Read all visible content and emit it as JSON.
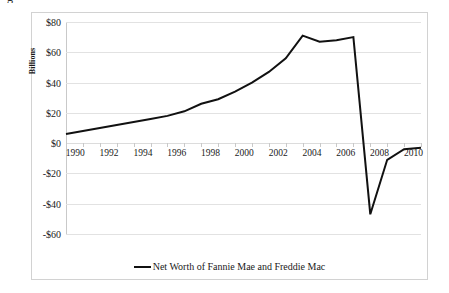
{
  "caption_fragment": "g",
  "chart_data": {
    "type": "line",
    "title": "",
    "xlabel": "",
    "ylabel": "Billions",
    "ylim": [
      -60,
      80
    ],
    "xlim": [
      1990,
      2011
    ],
    "ytick_step": 20,
    "grid": true,
    "legend_position": "bottom-center",
    "ytick_labels": [
      "$80",
      "$60",
      "$40",
      "$20",
      "$0",
      "-$20",
      "-$40",
      "-$60"
    ],
    "ytick_values": [
      80,
      60,
      40,
      20,
      0,
      -20,
      -40,
      -60
    ],
    "xtick_labels": [
      "1990",
      "1992",
      "1994",
      "1996",
      "1998",
      "2000",
      "2002",
      "2004",
      "2006",
      "2008",
      "2010"
    ],
    "xtick_values": [
      1990,
      1992,
      1994,
      1996,
      1998,
      2000,
      2002,
      2004,
      2006,
      2008,
      2010
    ],
    "x": [
      1990,
      1991,
      1992,
      1993,
      1994,
      1995,
      1996,
      1997,
      1998,
      1999,
      2000,
      2001,
      2002,
      2003,
      2004,
      2005,
      2006,
      2007,
      2008,
      2009,
      2010,
      2011
    ],
    "series": [
      {
        "name": "Net Worth of Fannie Mae and Freddie Mac",
        "color": "#111111",
        "values": [
          6,
          8,
          10,
          12,
          14,
          16,
          18,
          21,
          26,
          29,
          34,
          40,
          47,
          56,
          71,
          67,
          68,
          70,
          -47,
          -11,
          -4,
          -3
        ]
      }
    ],
    "legend": [
      "Net Worth of Fannie Mae and Freddie Mac"
    ],
    "annotations": []
  },
  "legend": {
    "swatch_name": "line-swatch",
    "label": "Net Worth of Fannie Mae and Freddie Mac"
  },
  "colors": {
    "series_line": "#111111",
    "gridline": "#e2e2e2",
    "frame_border": "#d2d2d2",
    "text": "#1a1a1a",
    "background": "#ffffff"
  }
}
